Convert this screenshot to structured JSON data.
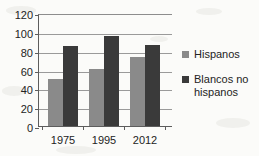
{
  "chart_data": {
    "type": "bar",
    "title": "",
    "subtitle": "",
    "xlabel": "",
    "ylabel": "",
    "categories": [
      "1975",
      "1995",
      "2012"
    ],
    "series": [
      {
        "name": "Hispanos",
        "values": [
          50,
          61,
          73
        ],
        "color": "#8a8a8a"
      },
      {
        "name": "Blancos no hispanos",
        "values": [
          85,
          96,
          86
        ],
        "color": "#3a3a3a"
      }
    ],
    "ylim": [
      0,
      120
    ],
    "yticks": [
      0,
      20,
      40,
      60,
      80,
      100,
      120
    ],
    "ytick_labels": [
      "0",
      "20",
      "40",
      "60",
      "80",
      "100",
      "120"
    ],
    "grid": "horizontal",
    "legend_position": "right"
  },
  "legend": {
    "entries": [
      {
        "label": "Hispanos"
      },
      {
        "label": "Blancos no hispanos"
      }
    ]
  },
  "colors": {
    "series_1": "#8a8a8a",
    "series_2": "#3a3a3a",
    "axis": "#5d5d5d",
    "grid": "#9a9a9a",
    "background": "#fbfbf9"
  }
}
